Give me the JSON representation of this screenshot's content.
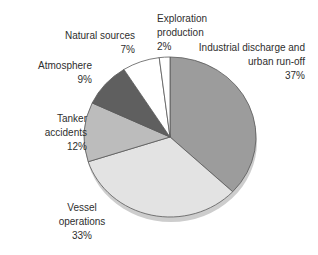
{
  "figure": {
    "background": "#ffffff",
    "width_px": 318,
    "height_px": 255
  },
  "chart_data": {
    "type": "pie",
    "title": "",
    "values_are": "percent",
    "direction": "clockwise",
    "start_angle_deg": 0,
    "legend": "none (direct slice labels)",
    "slices": [
      {
        "id": "industrial-discharge",
        "name": "Industrial discharge and urban run-off",
        "value": 37,
        "color": "#9c9c9c",
        "label": {
          "lines": [
            "Industrial discharge and",
            "urban run-off",
            "37%"
          ],
          "align": "right",
          "right": 13,
          "top": 41
        }
      },
      {
        "id": "vessel-operations",
        "name": "Vessel operations",
        "value": 33,
        "color": "#e3e3e3",
        "label": {
          "lines": [
            "Vessel",
            "operations",
            "33%"
          ],
          "align": "center",
          "left": 42,
          "width": 80,
          "top": 201
        }
      },
      {
        "id": "tanker-accidents",
        "name": "Tanker accidents",
        "value": 12,
        "color": "#bcbcbc",
        "label": {
          "lines": [
            "Tanker",
            "accidents",
            "12%"
          ],
          "align": "right",
          "right": 231,
          "top": 112
        }
      },
      {
        "id": "atmosphere",
        "name": "Atmosphere",
        "value": 9,
        "color": "#5f5f5f",
        "label": {
          "lines": [
            "Atmosphere",
            "9%"
          ],
          "align": "right",
          "right": 226,
          "top": 59
        }
      },
      {
        "id": "natural-sources",
        "name": "Natural sources",
        "value": 7,
        "color": "#ffffff",
        "label": {
          "lines": [
            "Natural sources",
            "7%"
          ],
          "align": "right",
          "right": 183,
          "top": 29
        }
      },
      {
        "id": "exploration-production",
        "name": "Exploration production",
        "value": 2,
        "color": "#ffffff",
        "label": {
          "lines": [
            "Exploration",
            "production",
            "2%"
          ],
          "align": "left",
          "left": 157,
          "top": 12
        }
      }
    ],
    "style": {
      "stroke_color": "#595959",
      "stroke_width": 0.8,
      "label_color": "#2e2e2e",
      "shadow_color": "#cdcdcd",
      "background": "#ffffff"
    },
    "geometry": {
      "cx": 170,
      "cy": 137,
      "rx": 86,
      "ry": 80,
      "shadow_dx": 1,
      "shadow_dy": 5
    }
  }
}
